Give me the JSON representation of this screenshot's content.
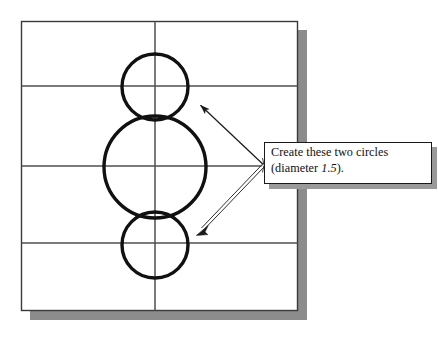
{
  "figure": {
    "type": "cad-drawing-instruction",
    "background_color": "#ffffff",
    "line_color": "#2b2b2b",
    "circle_color": "#111111",
    "shadow_color": "#8c8c8c",
    "frame": {
      "name": "drawing-frame",
      "x": 21,
      "y": 21,
      "width": 276,
      "height": 290,
      "border_color": "#3a3a3a",
      "shadow_offset": 9
    },
    "grid": {
      "horizontal_lines_y": [
        86,
        166,
        243
      ],
      "vertical_lines_x": [
        155
      ],
      "color": "#5a5a5a"
    },
    "circles": [
      {
        "name": "top-circle",
        "cx": 155,
        "cy": 87,
        "r": 33,
        "stroke_width": 3.4,
        "label": "small circle (top)"
      },
      {
        "name": "middle-circle",
        "cx": 155,
        "cy": 167,
        "r": 51,
        "stroke_width": 3.4,
        "label": "large circle (middle)"
      },
      {
        "name": "bottom-circle",
        "cx": 155,
        "cy": 245,
        "r": 33,
        "stroke_width": 3.4,
        "label": "small circle (bottom)"
      }
    ],
    "leaders": [
      {
        "name": "leader-arrow-top",
        "style": "solid",
        "from_x": 264,
        "from_y": 165,
        "to_x": 196,
        "to_y": 101
      },
      {
        "name": "leader-arrow-bottom",
        "style": "outlined",
        "from_x": 264,
        "from_y": 165,
        "to_x": 196,
        "to_y": 232
      }
    ]
  },
  "callout": {
    "name": "callout-note",
    "line1": "Create these two circles",
    "line2_prefix": "(diameter ",
    "line2_value": "1.5",
    "line2_suffix": ").",
    "full_text": "Create these two circles (diameter 1.5).",
    "box": {
      "x": 264,
      "y": 142,
      "width": 168,
      "height": 42
    },
    "text_color": "#111111",
    "border_color": "#1a1a1a",
    "shadow_color": "#9a9a9a"
  }
}
